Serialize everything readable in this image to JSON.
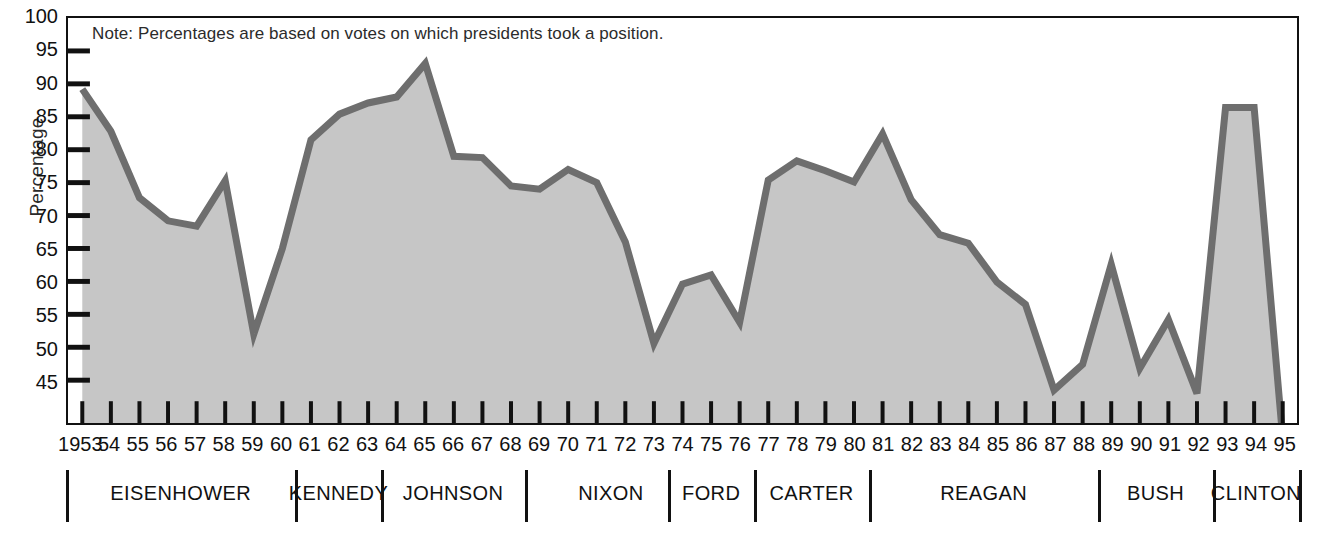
{
  "note": "Note: Percentages are based on votes on which presidents took a position.",
  "axes": {
    "ylabel": "Percentage",
    "yticks": [
      100,
      95,
      90,
      85,
      80,
      75,
      70,
      65,
      60,
      55,
      50,
      45
    ],
    "ylim": [
      38.5,
      100
    ],
    "xlim": [
      1952.5,
      1995.5
    ]
  },
  "colors": {
    "fill": "#c6c6c6",
    "line": "#6e6e6e",
    "axis": "#111111",
    "text": "#111111"
  },
  "chart_data": {
    "type": "area",
    "title": "",
    "xlabel": "",
    "ylabel": "Percentage",
    "grid": false,
    "legend": "none",
    "ylim": [
      38.5,
      100
    ],
    "annotations": [
      "Note: Percentages are based on votes on which presidents took a position."
    ],
    "categories": [
      "1953",
      "54",
      "55",
      "56",
      "57",
      "58",
      "59",
      "60",
      "61",
      "62",
      "63",
      "64",
      "65",
      "66",
      "67",
      "68",
      "69",
      "70",
      "71",
      "72",
      "73",
      "74",
      "75",
      "76",
      "77",
      "78",
      "79",
      "80",
      "81",
      "82",
      "83",
      "84",
      "85",
      "86",
      "87",
      "88",
      "89",
      "90",
      "91",
      "92",
      "93",
      "94",
      "95"
    ],
    "x": [
      1953,
      1954,
      1955,
      1956,
      1957,
      1958,
      1959,
      1960,
      1961,
      1962,
      1963,
      1964,
      1965,
      1966,
      1967,
      1968,
      1969,
      1970,
      1971,
      1972,
      1973,
      1974,
      1975,
      1976,
      1977,
      1978,
      1979,
      1980,
      1981,
      1982,
      1983,
      1984,
      1985,
      1986,
      1987,
      1988,
      1989,
      1990,
      1991,
      1992,
      1993,
      1994,
      1995
    ],
    "values": [
      89.2,
      82.8,
      72.7,
      69.2,
      68.4,
      75.3,
      52.0,
      65.0,
      81.5,
      85.4,
      87.1,
      88.0,
      93.1,
      79.0,
      78.8,
      74.5,
      74.0,
      77.0,
      75.0,
      66.0,
      50.6,
      59.6,
      61.0,
      53.8,
      75.4,
      78.3,
      76.8,
      75.1,
      82.4,
      72.4,
      67.1,
      65.8,
      59.9,
      56.5,
      43.5,
      47.4,
      62.6,
      46.8,
      54.2,
      43.0,
      86.4,
      86.4,
      36.2
    ],
    "series": [
      {
        "name": "Presidential success rate on congressional votes",
        "values": [
          89.2,
          82.8,
          72.7,
          69.2,
          68.4,
          75.3,
          52.0,
          65.0,
          81.5,
          85.4,
          87.1,
          88.0,
          93.1,
          79.0,
          78.8,
          74.5,
          74.0,
          77.0,
          75.0,
          66.0,
          50.6,
          59.6,
          61.0,
          53.8,
          75.4,
          78.3,
          76.8,
          75.1,
          82.4,
          72.4,
          67.1,
          65.8,
          59.9,
          56.5,
          43.5,
          47.4,
          62.6,
          46.8,
          54.2,
          43.0,
          86.4,
          86.4,
          36.2
        ]
      }
    ],
    "presidents": [
      {
        "name": "EISENHOWER",
        "start": 1953,
        "end": 1960
      },
      {
        "name": "KENNEDY",
        "start": 1961,
        "end": 1963
      },
      {
        "name": "JOHNSON",
        "start": 1964,
        "end": 1968
      },
      {
        "name": "NIXON",
        "start": 1969,
        "end": 1974
      },
      {
        "name": "FORD",
        "start": 1974,
        "end": 1976
      },
      {
        "name": "CARTER",
        "start": 1977,
        "end": 1980
      },
      {
        "name": "REAGAN",
        "start": 1981,
        "end": 1988
      },
      {
        "name": "BUSH",
        "start": 1989,
        "end": 1992
      },
      {
        "name": "CLINTON",
        "start": 1993,
        "end": 1995
      }
    ]
  }
}
